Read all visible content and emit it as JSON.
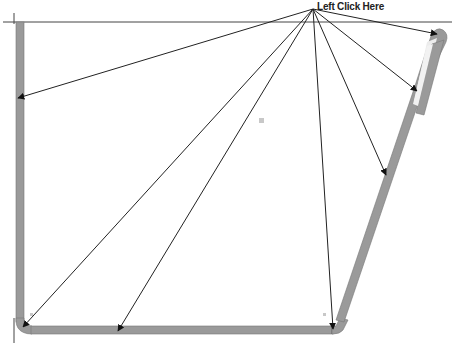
{
  "instruction": {
    "text": "Left Click Here",
    "x": 317,
    "y": 1
  },
  "colors": {
    "background": "#ffffff",
    "wall": "#9a9a9a",
    "wall_highlight": "#e6e6e6",
    "arrow": "#222222",
    "guide_line": "#444444"
  },
  "origin": {
    "x": 313,
    "y": 9
  },
  "arrow_targets": [
    {
      "name": "left-wall-mid",
      "x": 18,
      "y": 98
    },
    {
      "name": "bottom-left-corner",
      "x": 23,
      "y": 328
    },
    {
      "name": "bottom-edge-left",
      "x": 118,
      "y": 332
    },
    {
      "name": "bottom-right-corner",
      "x": 333,
      "y": 330
    },
    {
      "name": "slanted-wall-mid",
      "x": 386,
      "y": 175
    },
    {
      "name": "inner-slot",
      "x": 417,
      "y": 90
    },
    {
      "name": "top-cap",
      "x": 437,
      "y": 34
    }
  ]
}
